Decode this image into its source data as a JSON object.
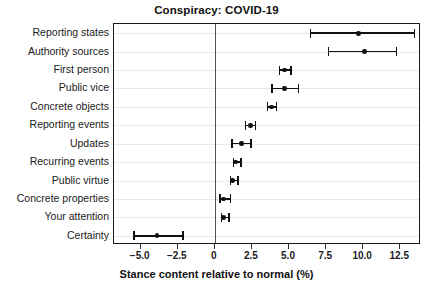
{
  "chart_data": {
    "type": "scatter",
    "title": "Conspiracy: COVID-19",
    "xlabel": "Stance content relative to normal (%)",
    "ylabel": "",
    "xlim": [
      -6.8,
      13.9
    ],
    "ylim": [
      0,
      12
    ],
    "grid": true,
    "legend": null,
    "orientation": "horizontal",
    "reference_line": 0,
    "xticks": [
      -5.0,
      -2.5,
      0,
      2.5,
      5.0,
      7.5,
      10.0,
      12.5
    ],
    "xticklabels": [
      "−5.0",
      "−2.5",
      "0",
      "2.5",
      "5.0",
      "7.5",
      "10.0",
      "12.5"
    ],
    "categories": [
      "Reporting states",
      "Authority sources",
      "First person",
      "Public vice",
      "Concrete objects",
      "Reporting events",
      "Updates",
      "Recurring events",
      "Public virtue",
      "Concrete properties",
      "Your attention",
      "Certainty"
    ],
    "values": [
      9.7,
      10.1,
      4.7,
      4.7,
      3.8,
      2.4,
      1.8,
      1.4,
      1.2,
      0.6,
      0.6,
      -3.9
    ],
    "ci_lower": [
      6.4,
      7.6,
      4.3,
      3.8,
      3.5,
      2.0,
      1.1,
      1.2,
      1.0,
      0.3,
      0.4,
      -5.5
    ],
    "ci_upper": [
      13.4,
      12.2,
      5.1,
      5.6,
      4.1,
      2.7,
      2.4,
      1.7,
      1.5,
      1.0,
      0.9,
      -2.2
    ],
    "series": [
      {
        "name": "Stance content",
        "points": [
          {
            "label": "Reporting states",
            "value": 9.7,
            "low": 6.4,
            "high": 13.4
          },
          {
            "label": "Authority sources",
            "value": 10.1,
            "low": 7.6,
            "high": 12.2
          },
          {
            "label": "First person",
            "value": 4.7,
            "low": 4.3,
            "high": 5.1
          },
          {
            "label": "Public vice",
            "value": 4.7,
            "low": 3.8,
            "high": 5.6
          },
          {
            "label": "Concrete objects",
            "value": 3.8,
            "low": 3.5,
            "high": 4.1
          },
          {
            "label": "Reporting events",
            "value": 2.4,
            "low": 2.0,
            "high": 2.7
          },
          {
            "label": "Updates",
            "value": 1.8,
            "low": 1.1,
            "high": 2.4
          },
          {
            "label": "Recurring events",
            "value": 1.4,
            "low": 1.2,
            "high": 1.7
          },
          {
            "label": "Public virtue",
            "value": 1.2,
            "low": 1.0,
            "high": 1.5
          },
          {
            "label": "Concrete properties",
            "value": 0.6,
            "low": 0.3,
            "high": 1.0
          },
          {
            "label": "Your attention",
            "value": 0.6,
            "low": 0.4,
            "high": 0.9
          },
          {
            "label": "Certainty",
            "value": -3.9,
            "low": -5.5,
            "high": -2.2
          }
        ]
      }
    ],
    "colors": {
      "marker": "#111111",
      "error_bar": "#111111",
      "grid": "#e8e8e8",
      "axis": "#1a1a1a",
      "reference_line": "#555555",
      "background": "#ffffff"
    }
  }
}
